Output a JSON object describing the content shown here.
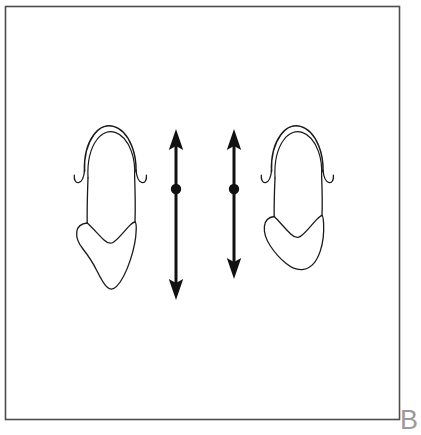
{
  "figure": {
    "panel_label": "B",
    "panel_label_color": "#9a9a9a",
    "background_color": "#ffffff",
    "border_color": "#4d4d4d",
    "ink_color": "#1a1a1a",
    "frame": {
      "x": 5,
      "y": 6,
      "width": 395,
      "height": 414
    },
    "caption_alt": "Line drawing of two tooth outlines with two vertical double-headed measurement arrows between them"
  },
  "specimens": [
    {
      "id": "left-tooth-outline",
      "name": "Left tooth outline",
      "label": "",
      "position": {
        "x": 78,
        "y": 126,
        "width": 62,
        "height": 164
      },
      "crown_height_px": 104,
      "root_height_px": 78,
      "features": [
        "double-line crown apex",
        "left cusp hook",
        "right cusp hook",
        "shield-shaped root"
      ]
    },
    {
      "id": "right-tooth-outline",
      "name": "Right tooth outline",
      "label": "",
      "position": {
        "x": 265,
        "y": 126,
        "width": 60,
        "height": 144
      },
      "crown_height_px": 104,
      "root_height_px": 60,
      "features": [
        "double-line crown apex",
        "left cusp hook",
        "right cusp hook",
        "rounded root"
      ]
    }
  ],
  "measurements": [
    {
      "id": "left-measure-arrow",
      "name": "Left double-headed measurement arrow",
      "label": "",
      "x": 176,
      "top_y": 131,
      "bottom_y": 298,
      "length_px": 167,
      "midpoint_y": 189,
      "arrowheads": "both",
      "has_center_dot": true
    },
    {
      "id": "right-measure-arrow",
      "name": "Right double-headed measurement arrow",
      "label": "",
      "x": 234,
      "top_y": 131,
      "bottom_y": 277,
      "length_px": 146,
      "midpoint_y": 189,
      "arrowheads": "both",
      "has_center_dot": true
    }
  ]
}
